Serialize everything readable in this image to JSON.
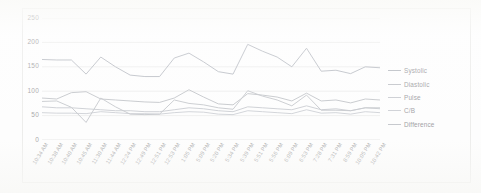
{
  "chart_data": {
    "type": "line",
    "title": "",
    "xlabel": "",
    "ylabel": "",
    "ylim": [
      0,
      250
    ],
    "yticks": [
      0,
      50,
      100,
      150,
      200,
      250
    ],
    "grid": true,
    "legend_position": "right",
    "categories": [
      "10:34 AM",
      "10:38 AM",
      "10:40 AM",
      "10:45 AM",
      "11:30 AM",
      "11:44 AM",
      "12:24 PM",
      "12:49 PM",
      "12:51 PM",
      "12:53 PM",
      "1:05 PM",
      "5:09 PM",
      "5:20 PM",
      "5:34 PM",
      "5:39 PM",
      "5:51 PM",
      "5:56 PM",
      "6:09 PM",
      "6:53 PM",
      "7:28 PM",
      "7:31 PM",
      "8:59 PM",
      "10:05 PM",
      "10:42 PM"
    ],
    "series": [
      {
        "name": "Systolic",
        "color": "#a9adb5",
        "values": [
          165,
          164,
          164,
          135,
          170,
          150,
          133,
          130,
          130,
          168,
          178,
          160,
          140,
          135,
          196,
          182,
          170,
          150,
          188,
          141,
          143,
          136,
          150,
          148
        ]
      },
      {
        "name": "Diastolic",
        "color": "#b3b6bc",
        "values": [
          86,
          84,
          97,
          99,
          84,
          82,
          80,
          78,
          77,
          86,
          103,
          88,
          74,
          72,
          95,
          92,
          88,
          80,
          96,
          80,
          82,
          76,
          84,
          82
        ]
      },
      {
        "name": "Pulse",
        "color": "#bdc0c6",
        "values": [
          68,
          66,
          66,
          64,
          62,
          60,
          60,
          58,
          58,
          62,
          66,
          64,
          60,
          58,
          68,
          66,
          64,
          62,
          70,
          62,
          64,
          60,
          66,
          64
        ]
      },
      {
        "name": "C/B",
        "color": "#c2c5cb",
        "values": [
          56,
          55,
          55,
          54,
          58,
          56,
          54,
          54,
          53,
          56,
          58,
          57,
          53,
          52,
          60,
          58,
          56,
          54,
          62,
          55,
          56,
          53,
          58,
          56
        ]
      },
      {
        "name": "Difference",
        "color": "#b7bac0",
        "values": [
          79,
          80,
          67,
          36,
          86,
          68,
          53,
          52,
          53,
          82,
          75,
          72,
          66,
          63,
          101,
          90,
          82,
          70,
          92,
          61,
          61,
          60,
          66,
          66
        ]
      }
    ]
  },
  "legend": {
    "items": [
      {
        "label": "Systolic"
      },
      {
        "label": "Diastolic"
      },
      {
        "label": "Pulse"
      },
      {
        "label": "C/B"
      },
      {
        "label": "Difference"
      }
    ]
  }
}
